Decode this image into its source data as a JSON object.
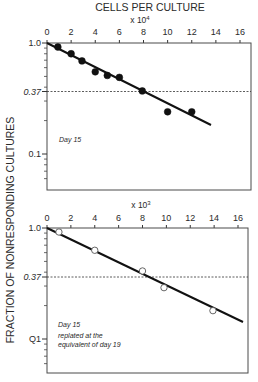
{
  "figure": {
    "top_title": "CELLS PER CULTURE",
    "ylabel": "FRACTION OF NONRESPONDING CULTURES"
  },
  "chart_data": [
    {
      "type": "scatter",
      "title": "CELLS PER CULTURE",
      "xlabel": "CELLS PER CULTURE",
      "x_multiplier": "x 10",
      "x_multiplier_exp": "4",
      "ylabel": "FRACTION OF NONRESPONDING CULTURES",
      "yscale": "log",
      "xlim": [
        0,
        16
      ],
      "ylim": [
        0.05,
        1.0
      ],
      "x_ticks": [
        "0",
        "2",
        "4",
        "6",
        "8",
        "10",
        "12",
        "14",
        "16"
      ],
      "y_ticks": [
        "1.0",
        "0.37",
        "0.1"
      ],
      "reference_line": {
        "y": 0.37,
        "style": "dashed"
      },
      "annotation": "Day 15",
      "marker": "filled-circle",
      "series": [
        {
          "name": "Day 15",
          "points": [
            {
              "x": 0.9,
              "y": 0.92
            },
            {
              "x": 2.0,
              "y": 0.8
            },
            {
              "x": 2.9,
              "y": 0.69
            },
            {
              "x": 4.0,
              "y": 0.55
            },
            {
              "x": 5.0,
              "y": 0.51
            },
            {
              "x": 6.0,
              "y": 0.49
            },
            {
              "x": 7.9,
              "y": 0.37
            },
            {
              "x": 10.0,
              "y": 0.24
            },
            {
              "x": 12.0,
              "y": 0.24
            }
          ]
        }
      ],
      "fit_line": {
        "x": [
          0,
          13.6
        ],
        "y": [
          1.0,
          0.18
        ]
      }
    },
    {
      "type": "scatter",
      "title": "",
      "xlabel": "CELLS PER CULTURE",
      "x_multiplier": "x 10",
      "x_multiplier_exp": "3",
      "ylabel": "FRACTION OF NONRESPONDING CULTURES",
      "yscale": "log",
      "xlim": [
        0,
        16
      ],
      "ylim": [
        0.05,
        1.0
      ],
      "x_ticks": [
        "0",
        "2",
        "4",
        "6",
        "8",
        "10",
        "12",
        "14",
        "16"
      ],
      "y_ticks": [
        "1.0",
        "0.37",
        "0.1"
      ],
      "reference_line": {
        "y": 0.37,
        "style": "dashed"
      },
      "annotation": [
        "Day 15",
        "replated at the",
        "equivalent of day 19"
      ],
      "marker": "open-circle",
      "series": [
        {
          "name": "Day 15 replated at the equivalent of day 19",
          "points": [
            {
              "x": 1.0,
              "y": 0.92
            },
            {
              "x": 4.0,
              "y": 0.63
            },
            {
              "x": 8.0,
              "y": 0.41
            },
            {
              "x": 9.8,
              "y": 0.29
            },
            {
              "x": 13.9,
              "y": 0.18
            }
          ]
        }
      ],
      "fit_line": {
        "x": [
          0,
          16.2
        ],
        "y": [
          1.0,
          0.14
        ]
      }
    }
  ],
  "top_panel": {
    "multiplier": "x 10",
    "exp": "4",
    "x_ticks": [
      "0",
      "2",
      "4",
      "6",
      "8",
      "10",
      "12",
      "14",
      "16"
    ],
    "y_tick_1": "1.0",
    "y_tick_037": "0.37",
    "y_tick_01": "0.1",
    "annotation": "Day 15"
  },
  "bottom_panel": {
    "multiplier": "x 10",
    "exp": "3",
    "x_ticks": [
      "0",
      "2",
      "4",
      "6",
      "8",
      "10",
      "12",
      "14",
      "16"
    ],
    "y_tick_1": "1.0",
    "y_tick_037": "0.37",
    "y_tick_01": "Q1",
    "annotation_1": "Day 15",
    "annotation_2": "replated at the",
    "annotation_3": "equivalent of day 19"
  },
  "colors": {
    "ink": "#1a1a1a",
    "frame": "#4a4a4a",
    "background": "#ffffff"
  }
}
